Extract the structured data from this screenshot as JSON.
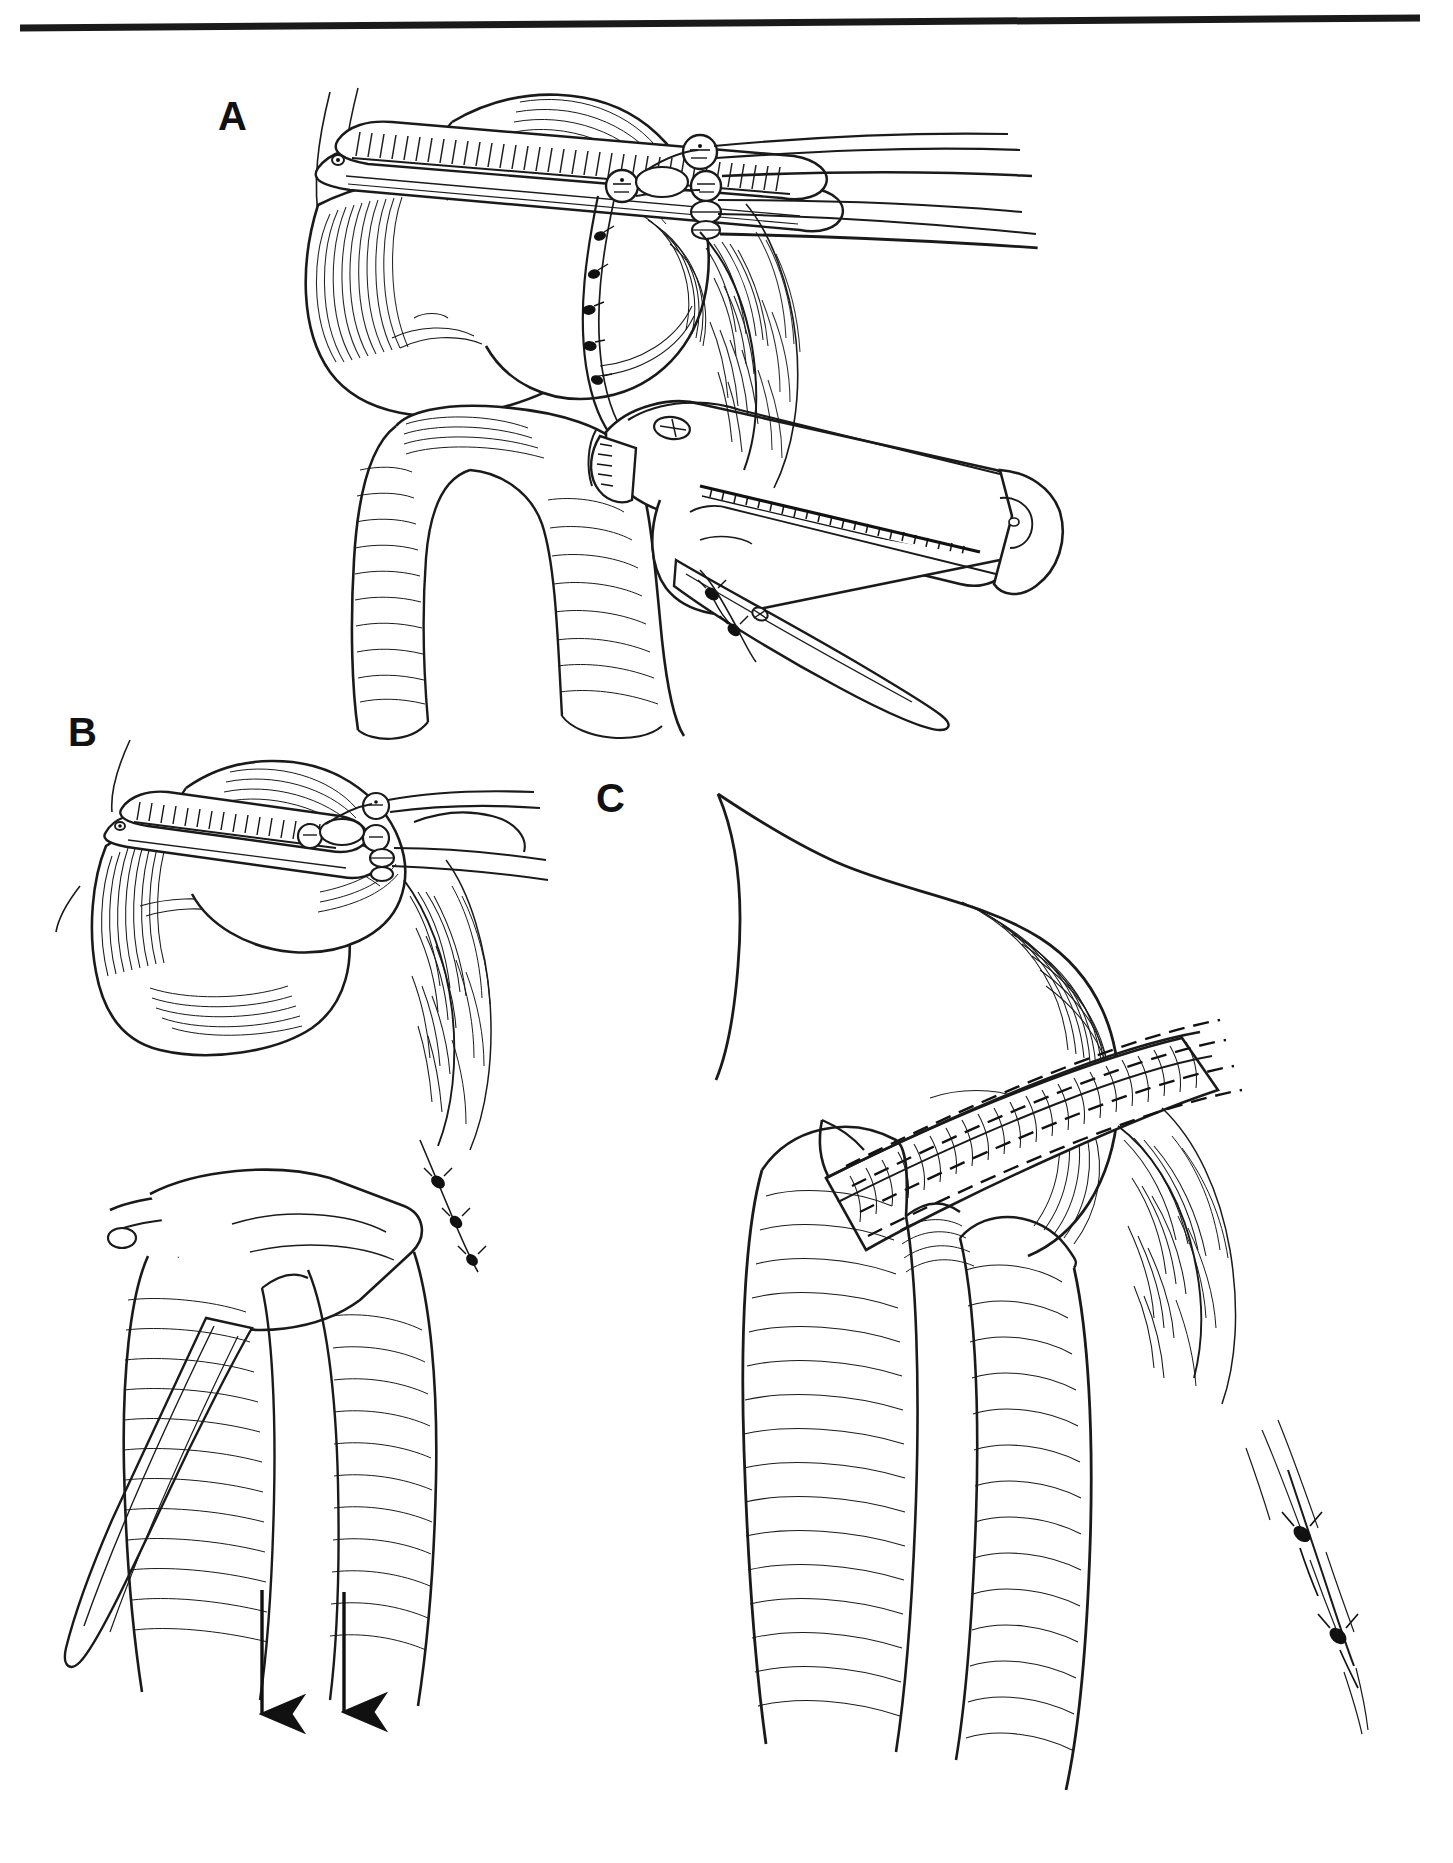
{
  "figure": {
    "kind": "line-art medical illustration",
    "background_color": "#ffffff",
    "ink_color": "#111111",
    "top_rule": {
      "name": "top-rule",
      "present": true,
      "thickness_px": 7,
      "x_start": 20,
      "x_end": 1420,
      "y_left": 27,
      "y_right": 18,
      "color": "#1a1a1a"
    },
    "panels": [
      {
        "id": "A",
        "label": "A",
        "label_x": 218,
        "label_y": 96,
        "caption": "Noncrushing clamp applied across the gastric fundus; linear stapler positioned on the specimen side and closed across the stomach.",
        "contents": [
          "occluding clamp with serrated jaw",
          "ratchet box-lock with pivot rings",
          "two long clamp handles fading off to the right",
          "stapling device body with cartridge channel",
          "anvil and hinge at the tissue line",
          "running suture line with knots along the stomach wall",
          "gastric fundus body",
          "duodenum / efferent limb loop",
          "greater omentum with fine vessel hatching",
          "ligated vessel stumps with knots"
        ]
      },
      {
        "id": "B",
        "label": "B",
        "label_x": 68,
        "label_y": 712,
        "caption": "Stapler fired and withdrawn while downward traction is applied to the specimen; clamp remains on the retained stomach.",
        "contents": [
          "clamp with serrated jaw and ratchet rings",
          "stapler jaw sliding free of the staple line",
          "staple line on the closed gastric edge",
          "two traction arrows directed inferiorly",
          "omentum with ligated vessels",
          "duodenal loop"
        ],
        "arrows": [
          {
            "name": "traction-arrow-left",
            "x": 262,
            "y_start": 1590,
            "y_end": 1726,
            "direction": "down"
          },
          {
            "name": "traction-arrow-right",
            "x": 344,
            "y_start": 1592,
            "y_end": 1724,
            "direction": "down"
          }
        ]
      },
      {
        "id": "C",
        "label": "C",
        "label_x": 596,
        "label_y": 778,
        "caption": "Completed double staggered staple line closing the gastric remnant after the instruments are removed.",
        "contents": [
          "completed double-row staple line shown as dashed rows",
          "inverted gastric closure edge",
          "gastric remnant body with contour hatching",
          "duodenal loop below",
          "omentum with ligature knots on the right"
        ],
        "staple_rows": 4,
        "staple_pattern": "dashed"
      }
    ],
    "labels": [
      {
        "name": "panel-label-a",
        "text": "A"
      },
      {
        "name": "panel-label-b",
        "text": "B"
      },
      {
        "name": "panel-label-c",
        "text": "C"
      }
    ]
  }
}
